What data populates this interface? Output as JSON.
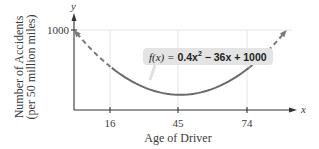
{
  "chart_data": {
    "type": "line",
    "title": "",
    "function_label": "f(x) = 0.4x² − 36x + 1000",
    "function": {
      "a": 0.4,
      "b": -36,
      "c": 1000
    },
    "xlabel": "Age of Driver",
    "ylabel_line1": "Number of Accidents",
    "ylabel_line2": "(per 50 million miles)",
    "x_axis_var": "x",
    "y_axis_var": "y",
    "x_ticks": [
      16,
      45,
      74
    ],
    "y_ticks": [
      1000
    ],
    "xlim": [
      0,
      95
    ],
    "ylim": [
      0,
      1100
    ],
    "solid_range": [
      16,
      74
    ],
    "dashed_ranges": [
      [
        0,
        16
      ],
      [
        74,
        90
      ]
    ],
    "key_points": [
      {
        "x": 0,
        "y": 1000
      },
      {
        "x": 16,
        "y": 526.4
      },
      {
        "x": 45,
        "y": 190
      },
      {
        "x": 74,
        "y": 526.4
      },
      {
        "x": 90,
        "y": 1000
      }
    ],
    "grid": "vertical lines at ticks, horizontal line at 1000",
    "colors": {
      "curve": "#6a6a6a",
      "axis": "#333333",
      "grid": "#e6e6e6",
      "label_box": "#e4e4e4"
    }
  },
  "labels": {
    "eq_fx": "f(x) =",
    "eq_rest_a": "0.4x",
    "eq_rest_sup": "2",
    "eq_rest_b": " − 36x + 1000",
    "tick_16": "16",
    "tick_45": "45",
    "tick_74": "74",
    "tick_1000": "1000",
    "x_var": "x",
    "y_var": "y",
    "xlabel": "Age of Driver",
    "ylabel_line1": "Number of Accidents",
    "ylabel_line2": "(per 50 million miles)"
  }
}
